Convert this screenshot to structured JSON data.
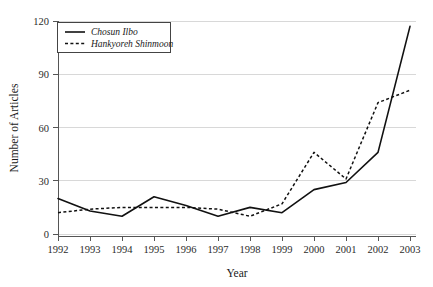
{
  "chart_data": {
    "type": "line",
    "title": "",
    "xlabel": "Year",
    "ylabel": "Number of Articles",
    "categories": [
      "1992",
      "1993",
      "1994",
      "1995",
      "1996",
      "1997",
      "1998",
      "1999",
      "2000",
      "2001",
      "2002",
      "2003"
    ],
    "x": [
      1992,
      1993,
      1994,
      1995,
      1996,
      1997,
      1998,
      1999,
      2000,
      2001,
      2002,
      2003
    ],
    "series": [
      {
        "name": "Chosun Ilbo",
        "style": "solid",
        "color": "#111111",
        "values": [
          20,
          13,
          10,
          21,
          16,
          10,
          15,
          12,
          25,
          29,
          46,
          117
        ]
      },
      {
        "name": "Hankyoreh Shinmoon",
        "style": "dotted",
        "color": "#111111",
        "values": [
          12,
          14,
          15,
          15,
          15,
          14,
          10,
          17,
          46,
          31,
          74,
          81
        ]
      }
    ],
    "ylim": [
      0,
      120
    ],
    "yticks": [
      0,
      30,
      60,
      90,
      120
    ],
    "ytick_labels": [
      "0",
      "30",
      "60",
      "90",
      "120"
    ],
    "xlim": [
      1992,
      2003
    ],
    "xticks": [
      1992,
      1993,
      1994,
      1995,
      1996,
      1997,
      1998,
      1999,
      2000,
      2001,
      2002,
      2003
    ],
    "grid": true,
    "grid_axis": "y",
    "legend_position": "top-left",
    "legend_entries": [
      "Chosun Ilbo",
      "Hankyoreh Shinmoon"
    ],
    "background_color": "#ffffff",
    "gridline_color": "#d8d8d8",
    "axis_color": "#555555"
  }
}
